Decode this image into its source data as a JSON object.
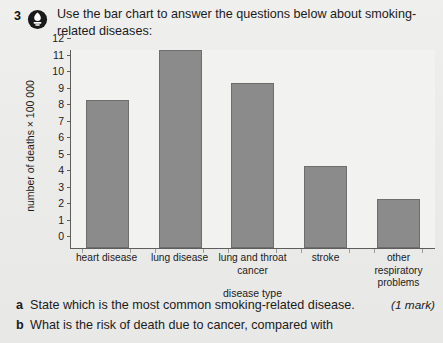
{
  "question": {
    "number": "3",
    "icon": "exam-badge-icon",
    "stem": "Use the bar chart to answer the questions below about smoking-related diseases:"
  },
  "chart_data": {
    "type": "bar",
    "title": "",
    "categories": [
      "heart disease",
      "lung disease",
      "lung and throat cancer",
      "stroke",
      "other respiratory problems"
    ],
    "values": [
      9,
      12,
      10,
      5,
      3
    ],
    "xlabel": "disease type",
    "ylabel": "number of deaths × 100 000",
    "ylim": [
      0,
      12
    ],
    "yticks": [
      "0",
      "1",
      "2",
      "3",
      "4",
      "5",
      "6",
      "7",
      "8",
      "9",
      "10",
      "11",
      "12"
    ],
    "grid": false,
    "legend": false,
    "bar_color": "#8b8b8b",
    "axis_color": "#5d5d5d",
    "plot_background": "#f2f2f1"
  },
  "sub_questions": [
    {
      "letter": "a",
      "text": "State which is the most common smoking-related disease.",
      "marks": "(1 mark)"
    },
    {
      "letter": "b",
      "text": "What is the risk of death due to cancer, compared with",
      "marks": ""
    }
  ],
  "colors": {
    "page_background": "#ebebea",
    "text": "#1b1b1b",
    "icon_badge": "#1a1a1a"
  }
}
